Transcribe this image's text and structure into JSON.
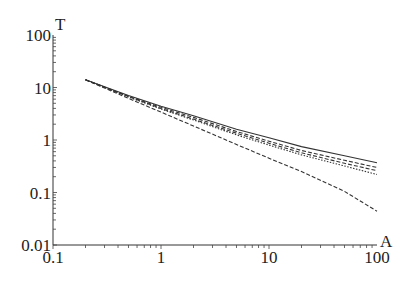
{
  "chart_data": {
    "type": "line",
    "title": "",
    "xlabel": "A",
    "ylabel": "T",
    "xscale": "log",
    "yscale": "log",
    "xlim": [
      0.1,
      100
    ],
    "ylim": [
      0.01,
      100
    ],
    "xticks": [
      "0.1",
      "1",
      "10",
      "100"
    ],
    "yticks": [
      "0.01",
      "0.1",
      "1",
      "10",
      "100"
    ],
    "grid": false,
    "legend": null,
    "x": [
      0.2,
      0.5,
      1,
      2,
      5,
      10,
      20,
      50,
      100
    ],
    "series": [
      {
        "name": "solid",
        "style": "solid",
        "values": [
          14,
          7.0,
          4.4,
          2.9,
          1.6,
          1.1,
          0.75,
          0.5,
          0.37
        ]
      },
      {
        "name": "dashed-1",
        "style": "dashed",
        "values": [
          14,
          6.8,
          4.2,
          2.7,
          1.45,
          0.95,
          0.63,
          0.41,
          0.3
        ]
      },
      {
        "name": "dashed-2",
        "style": "dashed",
        "values": [
          14,
          6.7,
          4.0,
          2.5,
          1.35,
          0.87,
          0.57,
          0.36,
          0.26
        ]
      },
      {
        "name": "dotted",
        "style": "dotted",
        "values": [
          14,
          6.6,
          3.9,
          2.4,
          1.25,
          0.8,
          0.52,
          0.32,
          0.22
        ]
      },
      {
        "name": "dashed-steep",
        "style": "dashed",
        "values": [
          14,
          6.2,
          3.4,
          1.85,
          0.82,
          0.45,
          0.25,
          0.105,
          0.044
        ]
      }
    ]
  },
  "axes": {
    "x_label": "A",
    "y_label": "T",
    "x_ticks": [
      "0.1",
      "1",
      "10",
      "100"
    ],
    "y_ticks": [
      "0.01",
      "0.1",
      "1",
      "10",
      "100"
    ]
  }
}
